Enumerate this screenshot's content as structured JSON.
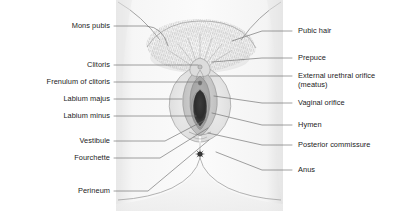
{
  "diagram": {
    "background_color": "#ffffff",
    "line_color": "#4a4a4a",
    "text_color": "#1b1b1b",
    "skin_fill": "#f4f4f4",
    "tissue_fill": "#d8d8d8",
    "orifice_fill": "#2b2b2b"
  },
  "labels_left": [
    {
      "key": "mons-pubis",
      "text": "Mons pubis",
      "x": 28,
      "y": 22,
      "width": 82,
      "line_x1": 114,
      "line_y1": 26,
      "line_x2": 146,
      "line_y2": 26,
      "curve": true,
      "cx": 168,
      "cy": 46
    },
    {
      "key": "clitoris",
      "text": "Clitoris",
      "x": 48,
      "y": 61,
      "width": 62,
      "line_x1": 114,
      "line_y1": 65,
      "line_x2": 198,
      "line_y2": 65,
      "curve": false
    },
    {
      "key": "frenulum-of-clitoris",
      "text": "Frenulum of clitoris",
      "x": 10,
      "y": 78,
      "width": 100,
      "line_x1": 114,
      "line_y1": 82,
      "line_x2": 202,
      "line_y2": 82,
      "curve": false
    },
    {
      "key": "labium-majus",
      "text": "Labium majus",
      "x": 28,
      "y": 95,
      "width": 82,
      "line_x1": 114,
      "line_y1": 99,
      "line_x2": 182,
      "line_y2": 99,
      "curve": false
    },
    {
      "key": "labium-minus",
      "text": "Labium minus",
      "x": 28,
      "y": 112,
      "width": 82,
      "line_x1": 114,
      "line_y1": 116,
      "line_x2": 196,
      "line_y2": 116,
      "curve": false
    },
    {
      "key": "vestibule",
      "text": "Vestibule",
      "x": 44,
      "y": 137,
      "width": 66,
      "line_x1": 114,
      "line_y1": 141,
      "line_x2": 165,
      "line_y2": 141,
      "curve": true,
      "cx": 205,
      "cy": 120
    },
    {
      "key": "fourchette",
      "text": "Fourchette",
      "x": 40,
      "y": 154,
      "width": 70,
      "line_x1": 114,
      "line_y1": 158,
      "line_x2": 160,
      "line_y2": 158,
      "curve": true,
      "cx": 208,
      "cy": 128
    },
    {
      "key": "perineum",
      "text": "Perineum",
      "x": 44,
      "y": 187,
      "width": 66,
      "line_x1": 114,
      "line_y1": 191,
      "line_x2": 148,
      "line_y2": 191,
      "curve": true,
      "cx": 209,
      "cy": 140
    }
  ],
  "labels_right": [
    {
      "key": "pubic-hair",
      "text": "Pubic hair",
      "x": 298,
      "y": 27,
      "line_x1": 262,
      "line_y1": 31,
      "line_x2": 292,
      "line_y2": 31,
      "anchor_x": 232,
      "anchor_y": 41
    },
    {
      "key": "prepuce",
      "text": "Prepuce",
      "x": 298,
      "y": 54,
      "line_x1": 262,
      "line_y1": 58,
      "line_x2": 292,
      "line_y2": 58,
      "anchor_x": 212,
      "anchor_y": 62
    },
    {
      "key": "external-urethral-orifice",
      "text": "External urethral orifice",
      "x": 298,
      "y": 72,
      "line_x1": 262,
      "line_y1": 76,
      "line_x2": 292,
      "line_y2": 76,
      "anchor_x": 210,
      "anchor_y": 76
    },
    {
      "key": "external-urethral-meatus",
      "text": "(meatus)",
      "x": 298,
      "y": 81,
      "sub": true
    },
    {
      "key": "vaginal-orifice",
      "text": "Vaginal orifice",
      "x": 298,
      "y": 99,
      "line_x1": 262,
      "line_y1": 103,
      "line_x2": 292,
      "line_y2": 103,
      "anchor_x": 214,
      "anchor_y": 96
    },
    {
      "key": "hymen",
      "text": "Hymen",
      "x": 298,
      "y": 121,
      "line_x1": 262,
      "line_y1": 125,
      "line_x2": 292,
      "line_y2": 125,
      "anchor_x": 212,
      "anchor_y": 113
    },
    {
      "key": "posterior-commissure",
      "text": "Posterior commissure",
      "x": 298,
      "y": 141,
      "line_x1": 262,
      "line_y1": 145,
      "line_x2": 292,
      "line_y2": 145,
      "anchor_x": 208,
      "anchor_y": 133
    },
    {
      "key": "anus",
      "text": "Anus",
      "x": 298,
      "y": 166,
      "line_x1": 262,
      "line_y1": 170,
      "line_x2": 292,
      "line_y2": 170,
      "anchor_x": 216,
      "anchor_y": 152
    }
  ]
}
